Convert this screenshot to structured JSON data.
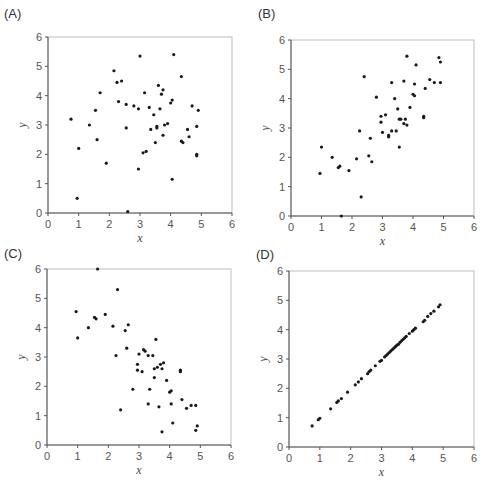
{
  "chart_data": [
    {
      "type": "scatter",
      "panel": "(A)",
      "xlabel": "x",
      "ylabel": "y",
      "xlim": [
        0,
        6
      ],
      "ylim": [
        0,
        6
      ],
      "xticks": [
        "0",
        "1",
        "2",
        "3",
        "4",
        "5",
        "6"
      ],
      "yticks": [
        "0",
        "1",
        "2",
        "3",
        "4",
        "5",
        "6"
      ],
      "grid": false,
      "points": [
        [
          0.75,
          3.2
        ],
        [
          1.0,
          2.2
        ],
        [
          0.95,
          0.5
        ],
        [
          1.35,
          3.0
        ],
        [
          1.55,
          3.5
        ],
        [
          1.6,
          2.5
        ],
        [
          1.7,
          4.1
        ],
        [
          1.9,
          1.7
        ],
        [
          2.15,
          4.85
        ],
        [
          2.25,
          4.45
        ],
        [
          2.3,
          3.8
        ],
        [
          2.4,
          4.5
        ],
        [
          2.55,
          3.7
        ],
        [
          2.55,
          2.9
        ],
        [
          2.6,
          0.05
        ],
        [
          2.8,
          3.65
        ],
        [
          2.95,
          3.55
        ],
        [
          2.95,
          1.5
        ],
        [
          3.0,
          5.35
        ],
        [
          3.1,
          2.05
        ],
        [
          3.15,
          4.1
        ],
        [
          3.2,
          2.1
        ],
        [
          3.3,
          3.6
        ],
        [
          3.35,
          2.85
        ],
        [
          3.45,
          3.35
        ],
        [
          3.5,
          2.4
        ],
        [
          3.55,
          2.9
        ],
        [
          3.55,
          2.95
        ],
        [
          3.6,
          4.35
        ],
        [
          3.65,
          3.55
        ],
        [
          3.7,
          4.05
        ],
        [
          3.75,
          4.2
        ],
        [
          3.75,
          2.65
        ],
        [
          3.8,
          3.0
        ],
        [
          3.9,
          3.05
        ],
        [
          4.0,
          3.75
        ],
        [
          4.05,
          3.85
        ],
        [
          4.05,
          1.15
        ],
        [
          4.1,
          5.4
        ],
        [
          4.35,
          4.65
        ],
        [
          4.35,
          2.45
        ],
        [
          4.4,
          2.4
        ],
        [
          4.55,
          2.85
        ],
        [
          4.6,
          2.6
        ],
        [
          4.7,
          3.65
        ],
        [
          4.85,
          2.95
        ],
        [
          4.85,
          2.0
        ],
        [
          4.85,
          1.95
        ],
        [
          4.9,
          3.5
        ]
      ]
    },
    {
      "type": "scatter",
      "panel": "(B)",
      "xlabel": "x",
      "ylabel": "y",
      "xlim": [
        0,
        6
      ],
      "ylim": [
        0,
        6
      ],
      "xticks": [
        "0",
        "1",
        "2",
        "3",
        "4",
        "5",
        "6"
      ],
      "yticks": [
        "0",
        "1",
        "2",
        "3",
        "4",
        "5",
        "6"
      ],
      "grid": false,
      "points": [
        [
          0.95,
          1.45
        ],
        [
          1.0,
          2.35
        ],
        [
          1.35,
          2.0
        ],
        [
          1.55,
          1.65
        ],
        [
          1.6,
          1.7
        ],
        [
          1.65,
          0.0
        ],
        [
          1.9,
          1.55
        ],
        [
          2.15,
          1.95
        ],
        [
          2.25,
          2.9
        ],
        [
          2.3,
          0.65
        ],
        [
          2.4,
          4.75
        ],
        [
          2.55,
          2.05
        ],
        [
          2.6,
          2.65
        ],
        [
          2.65,
          1.85
        ],
        [
          2.8,
          4.05
        ],
        [
          2.95,
          3.4
        ],
        [
          2.95,
          3.2
        ],
        [
          3.0,
          2.85
        ],
        [
          3.1,
          3.45
        ],
        [
          3.2,
          2.7
        ],
        [
          3.2,
          2.75
        ],
        [
          3.3,
          4.55
        ],
        [
          3.3,
          2.9
        ],
        [
          3.4,
          4.0
        ],
        [
          3.45,
          2.9
        ],
        [
          3.5,
          3.65
        ],
        [
          3.55,
          2.35
        ],
        [
          3.55,
          3.3
        ],
        [
          3.6,
          3.3
        ],
        [
          3.7,
          4.6
        ],
        [
          3.7,
          3.15
        ],
        [
          3.75,
          3.3
        ],
        [
          3.8,
          5.45
        ],
        [
          3.8,
          3.1
        ],
        [
          3.9,
          3.7
        ],
        [
          4.0,
          4.15
        ],
        [
          4.05,
          4.1
        ],
        [
          4.05,
          4.5
        ],
        [
          4.1,
          5.15
        ],
        [
          4.35,
          3.4
        ],
        [
          4.35,
          3.35
        ],
        [
          4.4,
          4.35
        ],
        [
          4.55,
          4.65
        ],
        [
          4.7,
          4.55
        ],
        [
          4.85,
          5.4
        ],
        [
          4.9,
          5.25
        ],
        [
          4.9,
          4.55
        ]
      ]
    },
    {
      "type": "scatter",
      "panel": "(C)",
      "xlabel": "x",
      "ylabel": "y",
      "xlim": [
        0,
        6
      ],
      "ylim": [
        0,
        6
      ],
      "xticks": [
        "0",
        "1",
        "2",
        "3",
        "4",
        "5",
        "6"
      ],
      "yticks": [
        "0",
        "1",
        "2",
        "3",
        "4",
        "5",
        "6"
      ],
      "grid": false,
      "points": [
        [
          0.95,
          4.55
        ],
        [
          1.0,
          3.65
        ],
        [
          1.35,
          4.0
        ],
        [
          1.55,
          4.35
        ],
        [
          1.6,
          4.3
        ],
        [
          1.65,
          6.0
        ],
        [
          1.9,
          4.45
        ],
        [
          2.15,
          4.05
        ],
        [
          2.25,
          3.05
        ],
        [
          2.3,
          5.3
        ],
        [
          2.4,
          1.2
        ],
        [
          2.55,
          3.9
        ],
        [
          2.6,
          3.3
        ],
        [
          2.65,
          4.1
        ],
        [
          2.8,
          1.9
        ],
        [
          2.95,
          2.75
        ],
        [
          2.95,
          2.55
        ],
        [
          3.0,
          3.1
        ],
        [
          3.1,
          2.5
        ],
        [
          3.15,
          3.25
        ],
        [
          3.2,
          3.2
        ],
        [
          3.3,
          3.05
        ],
        [
          3.3,
          1.4
        ],
        [
          3.35,
          1.9
        ],
        [
          3.45,
          3.05
        ],
        [
          3.5,
          2.3
        ],
        [
          3.5,
          2.6
        ],
        [
          3.55,
          3.6
        ],
        [
          3.6,
          2.65
        ],
        [
          3.65,
          1.3
        ],
        [
          3.7,
          2.75
        ],
        [
          3.75,
          2.6
        ],
        [
          3.75,
          0.45
        ],
        [
          3.8,
          2.8
        ],
        [
          3.9,
          2.2
        ],
        [
          4.0,
          1.8
        ],
        [
          4.05,
          1.85
        ],
        [
          4.05,
          1.4
        ],
        [
          4.1,
          0.75
        ],
        [
          4.35,
          2.55
        ],
        [
          4.35,
          2.5
        ],
        [
          4.4,
          1.55
        ],
        [
          4.55,
          1.25
        ],
        [
          4.7,
          1.35
        ],
        [
          4.85,
          0.5
        ],
        [
          4.85,
          1.35
        ],
        [
          4.9,
          0.65
        ]
      ]
    },
    {
      "type": "scatter",
      "panel": "(D)",
      "xlabel": "x",
      "ylabel": "y",
      "xlim": [
        0,
        6
      ],
      "ylim": [
        0,
        6
      ],
      "xticks": [
        "0",
        "1",
        "2",
        "3",
        "4",
        "5",
        "6"
      ],
      "yticks": [
        "0",
        "1",
        "2",
        "3",
        "4",
        "5",
        "6"
      ],
      "grid": false,
      "points": [
        [
          0.75,
          0.72
        ],
        [
          0.95,
          0.93
        ],
        [
          1.0,
          0.98
        ],
        [
          1.35,
          1.3
        ],
        [
          1.55,
          1.52
        ],
        [
          1.6,
          1.57
        ],
        [
          1.7,
          1.65
        ],
        [
          1.9,
          1.87
        ],
        [
          2.15,
          2.12
        ],
        [
          2.25,
          2.22
        ],
        [
          2.35,
          2.33
        ],
        [
          2.55,
          2.5
        ],
        [
          2.6,
          2.57
        ],
        [
          2.65,
          2.62
        ],
        [
          2.8,
          2.77
        ],
        [
          2.95,
          2.92
        ],
        [
          3.0,
          2.95
        ],
        [
          3.1,
          3.07
        ],
        [
          3.15,
          3.12
        ],
        [
          3.2,
          3.17
        ],
        [
          3.25,
          3.22
        ],
        [
          3.3,
          3.27
        ],
        [
          3.35,
          3.32
        ],
        [
          3.4,
          3.37
        ],
        [
          3.45,
          3.42
        ],
        [
          3.5,
          3.47
        ],
        [
          3.55,
          3.5
        ],
        [
          3.6,
          3.57
        ],
        [
          3.65,
          3.62
        ],
        [
          3.7,
          3.67
        ],
        [
          3.75,
          3.72
        ],
        [
          3.8,
          3.77
        ],
        [
          3.9,
          3.87
        ],
        [
          4.0,
          3.95
        ],
        [
          4.05,
          4.0
        ],
        [
          4.1,
          4.05
        ],
        [
          4.35,
          4.27
        ],
        [
          4.4,
          4.32
        ],
        [
          4.5,
          4.45
        ],
        [
          4.6,
          4.55
        ],
        [
          4.7,
          4.63
        ],
        [
          4.85,
          4.78
        ],
        [
          4.9,
          4.85
        ]
      ]
    }
  ]
}
